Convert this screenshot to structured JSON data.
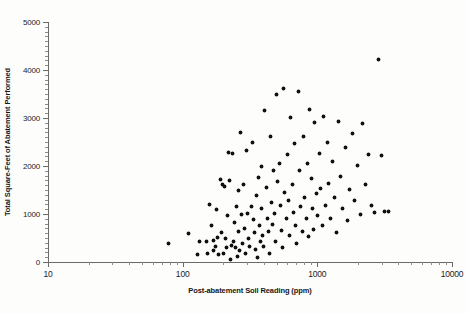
{
  "chart_data": {
    "type": "scatter",
    "title": "",
    "xlabel": "Post-abatement Soil Reading (ppm)",
    "ylabel": "Total Square-Feet of Abatement Performed",
    "xscale": "log",
    "yscale": "linear",
    "xlim": [
      10,
      10000
    ],
    "ylim": [
      0,
      5000
    ],
    "grid": false,
    "legend": null,
    "marker": "filled-star",
    "marker_color": "#111111",
    "xticks": [
      10,
      100,
      1000,
      10000
    ],
    "xticklabels": [
      "10",
      "100",
      "1000",
      "10000"
    ],
    "yticks": [
      0,
      1000,
      2000,
      3000,
      4000,
      5000
    ],
    "yticklabels": [
      "0",
      "1000",
      "2000",
      "3000",
      "4000",
      "5000"
    ],
    "x_minor_ticks_per_decade": [
      2,
      3,
      4,
      5,
      6,
      7,
      8,
      9
    ],
    "y_minor_tick_interval": 100,
    "n_points": 131,
    "points": [
      [
        78,
        390
      ],
      [
        110,
        600
      ],
      [
        128,
        150
      ],
      [
        133,
        420
      ],
      [
        150,
        420
      ],
      [
        152,
        185
      ],
      [
        158,
        1200
      ],
      [
        163,
        760
      ],
      [
        168,
        455
      ],
      [
        170,
        240
      ],
      [
        175,
        330
      ],
      [
        178,
        1090
      ],
      [
        182,
        520
      ],
      [
        186,
        150
      ],
      [
        190,
        1720
      ],
      [
        193,
        610
      ],
      [
        196,
        1610
      ],
      [
        200,
        175
      ],
      [
        205,
        1580
      ],
      [
        208,
        480
      ],
      [
        212,
        300
      ],
      [
        215,
        960
      ],
      [
        218,
        2280
      ],
      [
        222,
        1690
      ],
      [
        226,
        60
      ],
      [
        230,
        350
      ],
      [
        233,
        2260
      ],
      [
        238,
        430
      ],
      [
        242,
        820
      ],
      [
        246,
        300
      ],
      [
        250,
        1150
      ],
      [
        255,
        105
      ],
      [
        258,
        1480
      ],
      [
        262,
        640
      ],
      [
        266,
        230
      ],
      [
        270,
        2700
      ],
      [
        275,
        1000
      ],
      [
        280,
        390
      ],
      [
        285,
        1620
      ],
      [
        290,
        700
      ],
      [
        295,
        170
      ],
      [
        300,
        2320
      ],
      [
        305,
        1020
      ],
      [
        310,
        500
      ],
      [
        316,
        330
      ],
      [
        322,
        1150
      ],
      [
        328,
        2490
      ],
      [
        334,
        880
      ],
      [
        340,
        620
      ],
      [
        346,
        265
      ],
      [
        352,
        1390
      ],
      [
        358,
        95
      ],
      [
        364,
        1760
      ],
      [
        370,
        760
      ],
      [
        376,
        430
      ],
      [
        382,
        2000
      ],
      [
        388,
        1110
      ],
      [
        394,
        560
      ],
      [
        400,
        330
      ],
      [
        408,
        3150
      ],
      [
        416,
        1560
      ],
      [
        424,
        900
      ],
      [
        432,
        640
      ],
      [
        440,
        180
      ],
      [
        448,
        2620
      ],
      [
        456,
        1230
      ],
      [
        464,
        780
      ],
      [
        472,
        1900
      ],
      [
        480,
        1010
      ],
      [
        490,
        420
      ],
      [
        500,
        3480
      ],
      [
        510,
        1680
      ],
      [
        520,
        2050
      ],
      [
        530,
        1170
      ],
      [
        540,
        660
      ],
      [
        550,
        300
      ],
      [
        562,
        3620
      ],
      [
        574,
        1450
      ],
      [
        586,
        900
      ],
      [
        598,
        2230
      ],
      [
        610,
        1280
      ],
      [
        622,
        560
      ],
      [
        636,
        3010
      ],
      [
        650,
        1620
      ],
      [
        664,
        1040
      ],
      [
        678,
        2460
      ],
      [
        692,
        760
      ],
      [
        706,
        380
      ],
      [
        722,
        3550
      ],
      [
        738,
        1900
      ],
      [
        754,
        1160
      ],
      [
        770,
        640
      ],
      [
        788,
        2620
      ],
      [
        806,
        1350
      ],
      [
        824,
        900
      ],
      [
        842,
        2050
      ],
      [
        860,
        540
      ],
      [
        880,
        3180
      ],
      [
        900,
        1750
      ],
      [
        920,
        1120
      ],
      [
        940,
        680
      ],
      [
        960,
        2900
      ],
      [
        985,
        1420
      ],
      [
        1010,
        960
      ],
      [
        1035,
        2260
      ],
      [
        1060,
        1530
      ],
      [
        1090,
        760
      ],
      [
        1120,
        3030
      ],
      [
        1150,
        1180
      ],
      [
        1180,
        2500
      ],
      [
        1220,
        1640
      ],
      [
        1260,
        900
      ],
      [
        1300,
        2100
      ],
      [
        1340,
        1350
      ],
      [
        1390,
        620
      ],
      [
        1440,
        2930
      ],
      [
        1490,
        1780
      ],
      [
        1550,
        1120
      ],
      [
        1610,
        2390
      ],
      [
        1670,
        860
      ],
      [
        1740,
        1520
      ],
      [
        1820,
        2680
      ],
      [
        1900,
        1290
      ],
      [
        1990,
        2010
      ],
      [
        2080,
        1000
      ],
      [
        2180,
        2880
      ],
      [
        2290,
        1620
      ],
      [
        2410,
        2230
      ],
      [
        2540,
        1180
      ],
      [
        2680,
        1040
      ],
      [
        2830,
        4220
      ],
      [
        3000,
        2220
      ],
      [
        3180,
        1050
      ],
      [
        3380,
        1050
      ]
    ]
  },
  "caption": ""
}
